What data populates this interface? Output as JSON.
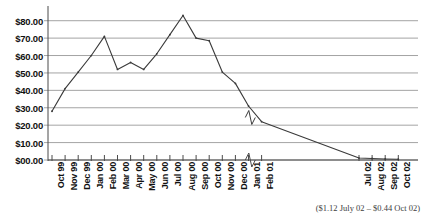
{
  "chart_data": {
    "type": "line",
    "title": "",
    "xlabel": "",
    "ylabel": "",
    "ylim": [
      0,
      85
    ],
    "grid": true,
    "legend": null,
    "axis_break_after": "Feb 01",
    "y_ticks": [
      "$00.00",
      "$10.00",
      "$20.00",
      "$30.00",
      "$40.00",
      "$50.00",
      "$60.00",
      "$70.00",
      "$80.00"
    ],
    "y_tick_values": [
      0,
      10,
      20,
      30,
      40,
      50,
      60,
      70,
      80
    ],
    "categories": [
      "Oct 99",
      "Nov 99",
      "Dec 99",
      "Jan 00",
      "Feb 00",
      "Mar 00",
      "Apr 00",
      "May 00",
      "Jun 00",
      "Jul 00",
      "Aug 00",
      "Sep 00",
      "Oct 00",
      "Nov 00",
      "Dec 00",
      "Jan 01",
      "Feb 01",
      "Jul 02",
      "Aug 02",
      "Sep 02",
      "Oct 02"
    ],
    "values": [
      28.0,
      41.0,
      50.5,
      60.0,
      71.0,
      52.0,
      56.0,
      52.0,
      61.0,
      72.0,
      83.0,
      70.0,
      68.5,
      50.5,
      44.0,
      31.0,
      22.0,
      1.12,
      0.85,
      0.6,
      0.44
    ],
    "series": [
      {
        "name": "Share price",
        "color": "#3a3a3a",
        "values": [
          28.0,
          41.0,
          50.5,
          60.0,
          71.0,
          52.0,
          56.0,
          52.0,
          61.0,
          72.0,
          83.0,
          70.0,
          68.5,
          50.5,
          44.0,
          31.0,
          22.0,
          1.12,
          0.85,
          0.6,
          0.44
        ]
      }
    ],
    "annotations": [
      "($1.12 July 02 – $0.44 Oct 02)"
    ],
    "caption": "($1.12 July 02 – $0.44 Oct 02)"
  },
  "colors": {
    "line": "#3a3a3a",
    "grid": "#9a9a9a",
    "axis": "#4a4a4a",
    "text": "#111111",
    "background": "#ffffff"
  }
}
